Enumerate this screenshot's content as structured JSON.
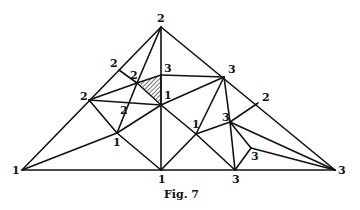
{
  "figure": {
    "caption": "Fig. 7",
    "vertices": [
      {
        "id": "top",
        "x": 161,
        "y": 27,
        "label": "2",
        "lx": 157,
        "ly": 22
      },
      {
        "id": "left",
        "x": 22,
        "y": 170,
        "label": "1",
        "lx": 12,
        "ly": 174
      },
      {
        "id": "right",
        "x": 335,
        "y": 170,
        "label": "3",
        "lx": 338,
        "ly": 174
      },
      {
        "id": "bmid",
        "x": 161,
        "y": 170,
        "label": "1",
        "lx": 158,
        "ly": 183
      },
      {
        "id": "b3",
        "x": 235,
        "y": 170,
        "label": "3",
        "lx": 232,
        "ly": 183
      },
      {
        "id": "e2",
        "x": 119,
        "y": 70,
        "label": "2",
        "lx": 110,
        "ly": 67
      },
      {
        "id": "l2",
        "x": 89,
        "y": 100,
        "label": "2",
        "lx": 80,
        "ly": 100
      },
      {
        "id": "i2",
        "x": 137,
        "y": 83,
        "label": "2",
        "lx": 130,
        "ly": 79
      },
      {
        "id": "i3",
        "x": 161,
        "y": 75,
        "label": "3",
        "lx": 164,
        "ly": 72
      },
      {
        "id": "c1",
        "x": 161,
        "y": 105,
        "label": "1",
        "lx": 164,
        "ly": 99
      },
      {
        "id": "r3",
        "x": 224,
        "y": 77,
        "label": "3",
        "lx": 228,
        "ly": 73
      },
      {
        "id": "r2",
        "x": 258,
        "y": 103,
        "label": "2",
        "lx": 262,
        "ly": 101
      },
      {
        "id": "m3",
        "x": 230,
        "y": 122,
        "label": "3",
        "lx": 222,
        "ly": 121
      },
      {
        "id": "l1",
        "x": 117,
        "y": 133,
        "label": "1",
        "lx": 113,
        "ly": 146
      },
      {
        "id": "rc1",
        "x": 196,
        "y": 134,
        "label": "1",
        "lx": 192,
        "ly": 128
      },
      {
        "id": "s3",
        "x": 251,
        "y": 148,
        "label": "3",
        "lx": 251,
        "ly": 160
      }
    ],
    "edge_label": {
      "label": "2",
      "x": 120,
      "y": 114
    },
    "shaded_triangle": [
      "i2",
      "i3",
      "c1"
    ],
    "shade_color": "#111111"
  }
}
